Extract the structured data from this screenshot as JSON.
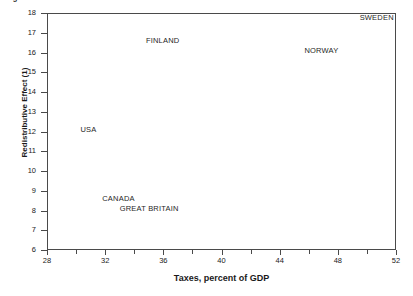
{
  "figure": {
    "caption": "Figure 1.  Redistributive Effect and Tax Levels",
    "caption_clipped": true
  },
  "chart_data": {
    "type": "scatter",
    "title": "Figure 1.  Redistributive Effect and Tax Levels",
    "xlabel": "Taxes, percent of GDP",
    "ylabel": "Redistributive Effect (1)",
    "xlim": [
      28,
      52
    ],
    "ylim": [
      6,
      18
    ],
    "grid": false,
    "legend": null,
    "markers_visible": false,
    "label_only": true,
    "x_ticks_major": [
      28,
      32,
      36,
      40,
      44,
      48,
      52
    ],
    "x_ticks_minor": [
      30,
      34,
      38,
      42,
      46,
      50
    ],
    "y_ticks": [
      6,
      7,
      8,
      9,
      10,
      11,
      12,
      13,
      14,
      15,
      16,
      17,
      18
    ],
    "points": [
      {
        "name": "SWEDEN",
        "x": 49.5,
        "y": 17.75,
        "label_anchor": "left"
      },
      {
        "name": "FINLAND",
        "x": 34.8,
        "y": 16.6,
        "label_anchor": "left"
      },
      {
        "name": "NORWAY",
        "x": 45.7,
        "y": 16.1,
        "label_anchor": "left"
      },
      {
        "name": "USA",
        "x": 30.3,
        "y": 12.1,
        "label_anchor": "left"
      },
      {
        "name": "CANADA",
        "x": 31.8,
        "y": 8.6,
        "label_anchor": "left"
      },
      {
        "name": "GREAT BRITAIN",
        "x": 33.0,
        "y": 8.1,
        "label_anchor": "left"
      }
    ]
  },
  "colors": {
    "axis": "#4a4a4a",
    "text": "#1a1a1a",
    "background": "#ffffff"
  }
}
